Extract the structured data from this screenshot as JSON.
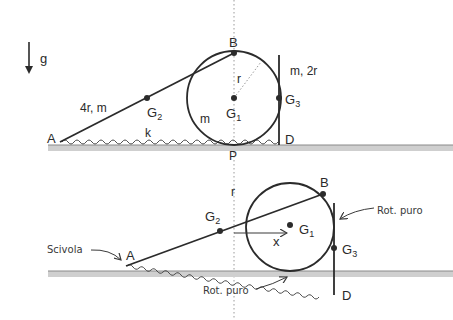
{
  "gravity": {
    "label": "g"
  },
  "top_panel": {
    "points": {
      "A": "A",
      "B": "B",
      "D": "D",
      "P": "P"
    },
    "centers": {
      "G1": "G",
      "G1_sub": "1",
      "G2": "G",
      "G2_sub": "2",
      "G3": "G",
      "G3_sub": "3"
    },
    "rod_label": "4r, m",
    "disk_mass_label": "m",
    "radius_label": "r",
    "spring_label": "k",
    "bar_label": "m, 2r"
  },
  "bottom_panel": {
    "points": {
      "A": "A",
      "B": "B",
      "D": "D"
    },
    "centers": {
      "G1": "G",
      "G1_sub": "1",
      "G2": "G",
      "G2_sub": "2",
      "G3": "G",
      "G3_sub": "3"
    },
    "axis_label": "r",
    "displacement_label": "x",
    "annotations": {
      "slides": "Scivola",
      "pure_rolling_bar": "Rot. puro",
      "pure_rolling_ground": "Rot. puro"
    }
  },
  "colors": {
    "stroke": "#2b2b2b",
    "ground": "#cfcfcf",
    "ground_edge": "#8a8a8a",
    "dotted": "#9a9a9a"
  }
}
